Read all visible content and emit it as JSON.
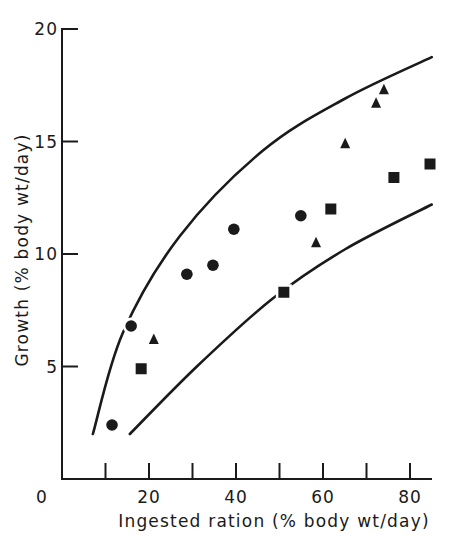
{
  "chart_data": {
    "type": "scatter",
    "title": "",
    "xlabel": "Ingested ration (% body wt/day)",
    "ylabel": "Growth (% body wt/day)",
    "xlim": [
      0,
      85
    ],
    "ylim": [
      0,
      20
    ],
    "grid": false,
    "legend": null,
    "x_ticks": [
      0,
      10,
      20,
      30,
      40,
      50,
      60,
      70,
      80
    ],
    "x_tick_labels": [
      "0",
      "",
      "20",
      "",
      "40",
      "",
      "60",
      "",
      "80"
    ],
    "y_ticks": [
      5,
      10,
      15,
      20
    ],
    "y_tick_labels": [
      "5",
      "10",
      "15",
      "20"
    ],
    "series": [
      {
        "name": "circles",
        "marker": "circle",
        "points": [
          {
            "x": 11.5,
            "y": 2.4
          },
          {
            "x": 15.9,
            "y": 6.8
          },
          {
            "x": 28.7,
            "y": 9.1
          },
          {
            "x": 34.7,
            "y": 9.5
          },
          {
            "x": 39.5,
            "y": 11.1
          },
          {
            "x": 54.9,
            "y": 11.7
          }
        ]
      },
      {
        "name": "triangles",
        "marker": "triangle",
        "points": [
          {
            "x": 21.1,
            "y": 6.2
          },
          {
            "x": 58.4,
            "y": 10.5
          },
          {
            "x": 65.1,
            "y": 14.9
          },
          {
            "x": 72.2,
            "y": 16.7
          },
          {
            "x": 74.0,
            "y": 17.3
          }
        ]
      },
      {
        "name": "squares",
        "marker": "square",
        "points": [
          {
            "x": 18.2,
            "y": 4.9
          },
          {
            "x": 51.0,
            "y": 8.3
          },
          {
            "x": 61.8,
            "y": 12.0
          },
          {
            "x": 76.3,
            "y": 13.4
          },
          {
            "x": 84.6,
            "y": 14.0
          }
        ]
      }
    ],
    "curves": [
      {
        "name": "upper-bound",
        "points": [
          {
            "x": 7.1,
            "y": 2.0
          },
          {
            "x": 14.0,
            "y": 6.5
          },
          {
            "x": 27.1,
            "y": 10.8
          },
          {
            "x": 46.2,
            "y": 14.6
          },
          {
            "x": 65.0,
            "y": 16.9
          },
          {
            "x": 85.0,
            "y": 18.75
          }
        ]
      },
      {
        "name": "lower-bound",
        "points": [
          {
            "x": 15.6,
            "y": 2.0
          },
          {
            "x": 31.0,
            "y": 5.0
          },
          {
            "x": 48.3,
            "y": 8.0
          },
          {
            "x": 65.0,
            "y": 10.2
          },
          {
            "x": 85.0,
            "y": 12.2
          }
        ]
      }
    ],
    "colors": {
      "ink": "#1a1a1a",
      "background": "#ffffff"
    }
  }
}
